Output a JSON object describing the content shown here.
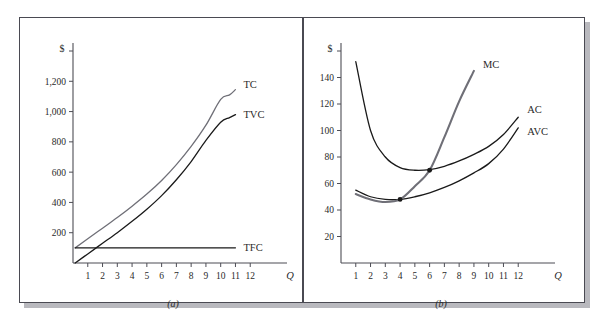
{
  "figure": {
    "panels": [
      {
        "id": "a",
        "caption": "(a)",
        "y_axis_title": "$",
        "x_axis_title": "Q"
      },
      {
        "id": "b",
        "caption": "(b)",
        "y_axis_title": "$",
        "x_axis_title": "Q"
      }
    ],
    "colors": {
      "frame": "#4a4a52",
      "shadow": "#b9b9be",
      "axis": "#4d4d55",
      "curve_black": "#1a1a1a",
      "curve_gray": "#6f6f77",
      "background": "#ffffff"
    }
  },
  "chart_data": [
    {
      "type": "line",
      "panel": "a",
      "title": "(a)",
      "xlabel": "Q",
      "ylabel": "$",
      "xlim": [
        0,
        13
      ],
      "ylim": [
        0,
        1400
      ],
      "xticks": [
        1,
        2,
        3,
        4,
        5,
        6,
        7,
        8,
        9,
        10,
        11,
        12
      ],
      "xtick_labels": [
        "1",
        "2",
        "3",
        "4",
        "5",
        "6",
        "7",
        "8",
        "9",
        "10",
        "11",
        "12"
      ],
      "yticks": [
        200,
        400,
        600,
        800,
        1000,
        1200,
        1400
      ],
      "ytick_labels": [
        "200",
        "400",
        "600",
        "800",
        "1,000",
        "1,200",
        ""
      ],
      "grid": false,
      "legend_position": "inline-right",
      "series": [
        {
          "name": "TC",
          "label": "TC",
          "color": "#6f6f77",
          "width": 1.3,
          "x": [
            0.15,
            1,
            2,
            3,
            4,
            5,
            6,
            7,
            8,
            9,
            10,
            10.6,
            11
          ],
          "values": [
            100,
            160,
            230,
            300,
            375,
            455,
            545,
            650,
            770,
            910,
            1080,
            1110,
            1145
          ]
        },
        {
          "name": "TVC",
          "label": "TVC",
          "color": "#1a1a1a",
          "width": 1.3,
          "x": [
            0.15,
            1,
            2,
            3,
            4,
            5,
            6,
            7,
            8,
            9,
            10,
            10.6,
            11
          ],
          "values": [
            0,
            60,
            130,
            200,
            275,
            355,
            445,
            550,
            670,
            810,
            930,
            960,
            980
          ]
        },
        {
          "name": "TFC",
          "label": "TFC",
          "color": "#1a1a1a",
          "width": 1.3,
          "x": [
            0.15,
            11
          ],
          "values": [
            100,
            100
          ]
        }
      ]
    },
    {
      "type": "line",
      "panel": "b",
      "title": "(b)",
      "xlabel": "Q",
      "ylabel": "$",
      "xlim": [
        0,
        13
      ],
      "ylim": [
        0,
        160
      ],
      "xticks": [
        1,
        2,
        3,
        4,
        5,
        6,
        7,
        8,
        9,
        10,
        11,
        12
      ],
      "xtick_labels": [
        "1",
        "2",
        "3",
        "4",
        "5",
        "6",
        "7",
        "8",
        "9",
        "10",
        "11",
        "12"
      ],
      "yticks": [
        20,
        40,
        60,
        80,
        100,
        120,
        140,
        160
      ],
      "ytick_labels": [
        "20",
        "40",
        "60",
        "80",
        "100",
        "120",
        "140",
        ""
      ],
      "grid": false,
      "legend_position": "inline-right",
      "series": [
        {
          "name": "AC",
          "label": "AC",
          "color": "#1a1a1a",
          "width": 1.3,
          "x": [
            1,
            2,
            3,
            4,
            5,
            6,
            7,
            8,
            9,
            10,
            11,
            12
          ],
          "values": [
            152,
            100,
            80,
            72,
            70,
            70.5,
            73,
            77,
            82,
            88,
            97,
            110
          ]
        },
        {
          "name": "AVC",
          "label": "AVC",
          "color": "#1a1a1a",
          "width": 1.3,
          "x": [
            1,
            2,
            3,
            4,
            5,
            6,
            7,
            8,
            9,
            10,
            11,
            12
          ],
          "values": [
            55,
            50,
            48,
            48,
            50,
            53,
            57,
            62,
            68,
            75,
            86,
            102
          ]
        },
        {
          "name": "MC",
          "label": "MC",
          "color": "#6f6f77",
          "width": 2.1,
          "x": [
            1,
            2,
            3,
            4,
            5,
            6,
            7,
            8,
            9
          ],
          "values": [
            52,
            48,
            46,
            48,
            58,
            70,
            95,
            122,
            145
          ]
        }
      ],
      "annotations": [
        {
          "name": "avc-min-intersection",
          "x": 4,
          "y": 48,
          "marker": "dot"
        },
        {
          "name": "ac-min-intersection",
          "x": 6,
          "y": 70,
          "marker": "dot"
        }
      ]
    }
  ]
}
